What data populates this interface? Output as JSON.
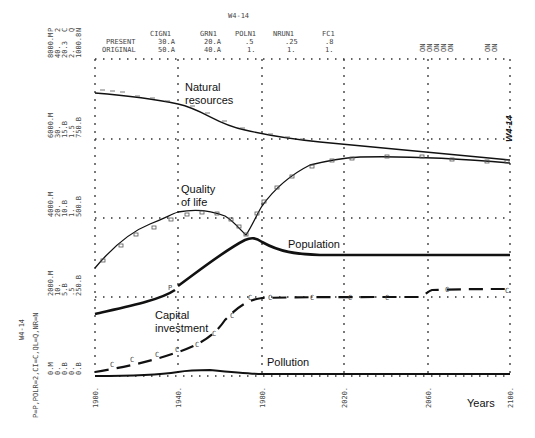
{
  "header": {
    "run_id": "W4-14",
    "params_table": {
      "columns": [
        "CIGN1",
        "GRN1",
        "POLN1",
        "NRUN1",
        "FC1"
      ],
      "rows": [
        {
          "label": "PRESENT",
          "values": [
            "30.A",
            "20.A",
            ".5",
            ".25",
            ".8"
          ]
        },
        {
          "label": "ORIGINAL",
          "values": [
            "50.A",
            "40.A",
            "1.",
            "1.",
            "1."
          ]
        }
      ]
    },
    "top_right_marks": "ON ON ON ON ON   ON ON"
  },
  "y_scales": [
    {
      "row": 0,
      "lines": [
        "8000.M",
        "40.",
        "20.3",
        "2.",
        "1000.8"
      ],
      "top_letters": "P 2 C Q N"
    },
    {
      "row": 1,
      "lines": [
        "6000.M",
        "30.",
        "15.B",
        "1.5",
        "750.B"
      ]
    },
    {
      "row": 2,
      "lines": [
        "4000.M",
        "20.",
        "10.B",
        "1.",
        "500.B"
      ]
    },
    {
      "row": 3,
      "lines": [
        "2000.M",
        "10.",
        "5.B",
        ".5",
        "250.B"
      ]
    },
    {
      "row": 4,
      "lines": [
        "0.M",
        "0.",
        "0.B",
        "0.",
        "0.B"
      ]
    }
  ],
  "side_labels": {
    "run_id": "W4-14",
    "legend_key": "P=P,POLR=2,CI=C,QL=Q,NR=N",
    "handwritten_note": "W4-14"
  },
  "chart_data": {
    "type": "line",
    "title": "W4-14",
    "xlabel": "Years",
    "ylabel": "",
    "x_ticks": [
      "1900.",
      "1940.",
      "1980.",
      "2020.",
      "2060.",
      "2100."
    ],
    "xlim": [
      1900,
      2100
    ],
    "grid": true,
    "annotations": [
      "Natural resources",
      "Quality of life",
      "Population",
      "Capital investment",
      "Pollution",
      "Years"
    ],
    "x": [
      1900,
      1920,
      1940,
      1960,
      1970,
      1980,
      2000,
      2020,
      2040,
      2060,
      2080,
      2100
    ],
    "series": [
      {
        "name": "Natural resources",
        "symbol": "N",
        "unit_scale": "0-1000.B",
        "values": [
          900,
          890,
          860,
          800,
          760,
          750,
          720,
          700,
          690,
          680,
          670,
          660
        ]
      },
      {
        "name": "Quality of life",
        "symbol": "Q",
        "unit_scale": "0-2",
        "values": [
          0.5,
          0.85,
          1.0,
          1.0,
          0.72,
          1.2,
          1.6,
          1.68,
          1.68,
          1.7,
          1.68,
          1.63
        ]
      },
      {
        "name": "Population",
        "symbol": "P",
        "unit_scale": "0-8000.M",
        "values": [
          1650,
          2100,
          2850,
          3700,
          3900,
          3500,
          3300,
          3270,
          3270,
          3270,
          3270,
          3270
        ]
      },
      {
        "name": "Capital investment",
        "symbol": "C",
        "unit_scale": "0-40",
        "values": [
          0.4,
          2.5,
          5.3,
          10.2,
          12.5,
          13.2,
          13.3,
          13.3,
          13.3,
          13.3,
          15.2,
          15.2
        ]
      },
      {
        "name": "Pollution",
        "symbol": "2",
        "unit_scale": "0-20",
        "values": [
          0.0,
          0.05,
          0.2,
          0.8,
          0.9,
          0.4,
          0.35,
          0.35,
          0.35,
          0.35,
          0.35,
          0.35
        ]
      }
    ]
  }
}
